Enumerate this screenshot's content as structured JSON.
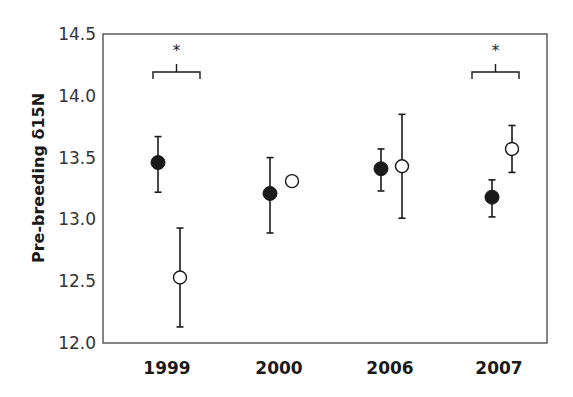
{
  "chart_data": {
    "type": "scatter",
    "title": "",
    "xlabel": "",
    "ylabel": "Pre-breeding δ15N",
    "ylim": [
      12.0,
      14.5
    ],
    "yticks": [
      12.0,
      12.5,
      13.0,
      13.5,
      14.0,
      14.5
    ],
    "ytick_labels": [
      "12.0",
      "12.5",
      "13.0",
      "13.5",
      "14.0",
      "14.5"
    ],
    "categories": [
      "1999",
      "2000",
      "2006",
      "2007"
    ],
    "grid": false,
    "legend": null,
    "series": [
      {
        "name": "filled",
        "marker": "filled-circle",
        "values": [
          13.46,
          13.21,
          13.41,
          13.18
        ],
        "error_low": [
          13.22,
          12.89,
          13.23,
          13.02
        ],
        "error_high": [
          13.67,
          13.5,
          13.57,
          13.32
        ]
      },
      {
        "name": "open",
        "marker": "open-circle",
        "values": [
          12.53,
          13.31,
          13.43,
          13.57
        ],
        "error_low": [
          12.13,
          null,
          13.01,
          13.38
        ],
        "error_high": [
          12.93,
          null,
          13.85,
          13.76
        ]
      }
    ],
    "annotations": [
      {
        "category": "1999",
        "text": "*",
        "type": "significance-bracket"
      },
      {
        "category": "2007",
        "text": "*",
        "type": "significance-bracket"
      }
    ]
  },
  "colors": {
    "ink": "#1a1a1a",
    "axis": "#444444",
    "background": "#ffffff"
  }
}
